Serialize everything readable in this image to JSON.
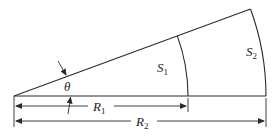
{
  "diagram": {
    "title": "",
    "labels": {
      "theta": "θ",
      "r1_main": "R",
      "r1_sub": "1",
      "r2_main": "R",
      "r2_sub": "2",
      "s1_main": "S",
      "s1_sub": "1",
      "s2_main": "S",
      "s2_sub": "2"
    },
    "geometry": {
      "center": [
        14,
        96
      ],
      "radius_inner": 174,
      "radius_outer": 252,
      "angle_deg": 20.2
    },
    "colors": {
      "stroke": "#2a2a2a",
      "background": "#ffffff"
    }
  }
}
